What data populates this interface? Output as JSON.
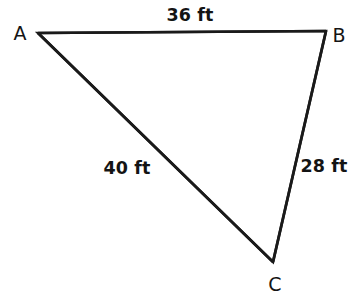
{
  "figure": {
    "type": "triangle-diagram",
    "background_color": "#ffffff",
    "stroke_color": "#1a1a1a",
    "text_color": "#141414",
    "canvas": {
      "width": 358,
      "height": 304
    },
    "vertices": [
      {
        "name": "A",
        "label": "A",
        "x": 38,
        "y": 33,
        "label_x": 20,
        "label_y": 33
      },
      {
        "name": "B",
        "label": "B",
        "x": 326,
        "y": 31,
        "label_x": 339,
        "label_y": 35
      },
      {
        "name": "C",
        "label": "C",
        "x": 273,
        "y": 262,
        "label_x": 275,
        "label_y": 284
      }
    ],
    "sides": [
      {
        "name": "AB",
        "from": "A",
        "to": "B",
        "label": "36 ft",
        "value": 36,
        "unit": "ft",
        "label_x": 190,
        "label_y": 16
      },
      {
        "name": "AC",
        "from": "A",
        "to": "C",
        "label": "40 ft",
        "value": 40,
        "unit": "ft",
        "label_x": 127,
        "label_y": 169
      },
      {
        "name": "BC",
        "from": "B",
        "to": "C",
        "label": "28 ft",
        "value": 28,
        "unit": "ft",
        "label_x": 324,
        "label_y": 167
      }
    ]
  }
}
